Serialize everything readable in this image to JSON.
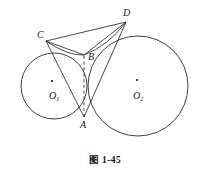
{
  "figure": {
    "caption_mark": "图",
    "caption_number": "1-45",
    "stroke_color": "#2b2b2b",
    "label_color": "#1a1a1a",
    "background": "#ffffff"
  },
  "circles": [
    {
      "name": "circle-o1",
      "center_label": "O",
      "center_subscript": "1",
      "cx": 54,
      "cy": 86,
      "r": 33,
      "center_dot_x": 52,
      "center_dot_y": 81,
      "label_x": 49,
      "label_y": 99
    },
    {
      "name": "circle-o2",
      "center_label": "O",
      "center_subscript": "2",
      "cx": 138,
      "cy": 86,
      "r": 50,
      "center_dot_x": 137,
      "center_dot_y": 80,
      "label_x": 133,
      "label_y": 99
    }
  ],
  "points": [
    {
      "name": "point-A",
      "label": "A",
      "x": 84,
      "y": 117,
      "label_x": 80,
      "label_y": 128
    },
    {
      "name": "point-B",
      "label": "B",
      "x": 84,
      "y": 55,
      "label_x": 88,
      "label_y": 60
    },
    {
      "name": "point-C",
      "label": "C",
      "x": 46,
      "y": 41,
      "label_x": 37,
      "label_y": 38
    },
    {
      "name": "point-D",
      "label": "D",
      "x": 126,
      "y": 22,
      "label_x": 123,
      "label_y": 16
    }
  ],
  "segments": [
    {
      "name": "segment-CD",
      "from": "C",
      "to": "D",
      "x1": 46,
      "y1": 41,
      "x2": 126,
      "y2": 22,
      "dashed": false
    },
    {
      "name": "segment-CB",
      "from": "C",
      "to": "B",
      "x1": 46,
      "y1": 41,
      "x2": 84,
      "y2": 55,
      "dashed": false
    },
    {
      "name": "segment-CA",
      "from": "C",
      "to": "A",
      "x1": 46,
      "y1": 41,
      "x2": 84,
      "y2": 117,
      "dashed": false
    },
    {
      "name": "segment-DB",
      "from": "D",
      "to": "B",
      "x1": 126,
      "y1": 22,
      "x2": 84,
      "y2": 55,
      "dashed": false
    },
    {
      "name": "segment-DA",
      "from": "D",
      "to": "A",
      "x1": 126,
      "y1": 22,
      "x2": 84,
      "y2": 117,
      "dashed": false
    },
    {
      "name": "segment-AB",
      "from": "A",
      "to": "B",
      "x1": 84,
      "y1": 117,
      "x2": 84,
      "y2": 55,
      "dashed": true
    }
  ],
  "arcs": [
    {
      "name": "arc-CB-on-o2",
      "d": "M 46 41 Q 68 56 84 55"
    },
    {
      "name": "arc-BD-on-o1",
      "d": "M 84 55 Q 108 46 126 22"
    }
  ]
}
